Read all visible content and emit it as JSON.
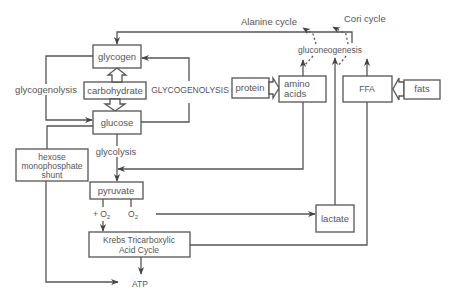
{
  "diagram": {
    "type": "metabolic-pathway",
    "nodes": {
      "glycogen": "glycogen",
      "carbohydrate": "carbohydrate",
      "glucose": "glucose",
      "hexose_line1": "hexose",
      "hexose_line2": "monophosphate",
      "hexose_line3": "shunt",
      "pyruvate": "pyruvate",
      "krebs_line1": "Krebs Tricarboxylic",
      "krebs_line2": "Acid Cycle",
      "atp": "ATP",
      "lactate": "lactate",
      "protein": "protein",
      "amino_line1": "amino",
      "amino_line2": "acids",
      "ffa": "FFA",
      "fats": "fats",
      "gluconeogenesis": "gluconeogenesis"
    },
    "labels": {
      "glycogenolysis_left": "glycogenolysis",
      "glycogenolysis_right": "GLYCOGENOLYSIS",
      "glycolysis": "glycolysis",
      "plus_o2": "+ O",
      "o2": "O",
      "o2_subscript": "2",
      "alanine_cycle": "Alanine cycle",
      "cori_cycle": "Cori cycle"
    },
    "edges": [
      {
        "from": "glycogen",
        "to": "glucose",
        "label": "glycogenolysis"
      },
      {
        "from": "glucose",
        "to": "glycogen",
        "label": "GLYCOGENOLYSIS"
      },
      {
        "from": "carbohydrate",
        "to": "glycogen"
      },
      {
        "from": "carbohydrate",
        "to": "glucose"
      },
      {
        "from": "glucose",
        "to": "pyruvate",
        "label": "glycolysis"
      },
      {
        "from": "glucose",
        "to": "hexose monophosphate shunt"
      },
      {
        "from": "hexose monophosphate shunt",
        "to": "ATP"
      },
      {
        "from": "pyruvate",
        "to": "Krebs Tricarboxylic Acid Cycle",
        "label": "+ O2"
      },
      {
        "from": "pyruvate",
        "to": "lactate",
        "label": "O2"
      },
      {
        "from": "Krebs Tricarboxylic Acid Cycle",
        "to": "ATP"
      },
      {
        "from": "protein",
        "to": "amino acids"
      },
      {
        "from": "fats",
        "to": "FFA"
      },
      {
        "from": "amino acids",
        "to": "gluconeogenesis"
      },
      {
        "from": "lactate",
        "to": "gluconeogenesis"
      },
      {
        "from": "FFA",
        "to": "gluconeogenesis"
      },
      {
        "from": "amino acids",
        "to": "pyruvate"
      },
      {
        "from": "FFA",
        "to": "Krebs Tricarboxylic Acid Cycle"
      },
      {
        "from": "gluconeogenesis",
        "to": "glycogen"
      },
      {
        "from": "gluconeogenesis",
        "to": "Alanine cycle",
        "style": "dashed"
      },
      {
        "from": "gluconeogenesis",
        "to": "Cori cycle",
        "style": "dashed"
      }
    ]
  }
}
